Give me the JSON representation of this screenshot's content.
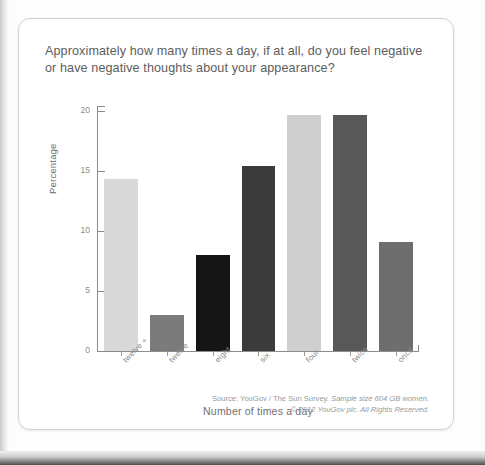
{
  "card": {
    "title": "Approximately how many times a day, if at all, do you feel negative or have negative thoughts about your appearance?",
    "footer_line_1_plain": "Source: YouGov / The Sun Survey.",
    "footer_line_1_italic": "Sample size 604 GB women.",
    "footer_line_2": "© 2012 YouGov plc. All Rights Reserved."
  },
  "chart_data": {
    "type": "bar",
    "title": "Approximately how many times a day, if at all, do you feel negative or have negative thoughts about your appearance?",
    "xlabel": "Number of times a day",
    "ylabel": "Percentage",
    "categories": [
      "twelve +",
      "twelve",
      "eight",
      "six",
      "four",
      "twice",
      "once"
    ],
    "values": [
      14.3,
      3.0,
      8.0,
      15.4,
      19.7,
      19.7,
      9.1
    ],
    "colors": [
      "#d9d9d9",
      "#7b7b7b",
      "#151515",
      "#3b3b3b",
      "#cfcfcf",
      "#585858",
      "#6e6e6e"
    ],
    "ylim": [
      0,
      20.5
    ],
    "yticks": [
      0,
      5,
      10,
      15,
      20
    ],
    "ytick_labels": [
      "0",
      "5",
      "10",
      "15",
      "20"
    ],
    "grid": false,
    "legend": false,
    "legend_position": "none"
  }
}
